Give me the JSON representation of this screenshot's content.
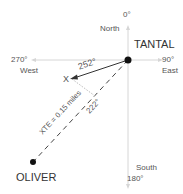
{
  "compass": {
    "north_deg": "0°",
    "north": "North",
    "east_deg": "90°",
    "east": "East",
    "south_deg": "180°",
    "south": "South",
    "west_deg": "270°",
    "west": "West"
  },
  "waypoints": {
    "origin": "TANTAL",
    "destination": "OLIVER",
    "current_position": "X"
  },
  "bearings": {
    "actual_track": "252°",
    "desired_track": "222°"
  },
  "cross_track_error": "XTE = 0.15 miles",
  "colors": {
    "axis": "#cfcfcf",
    "track": "#333333",
    "dot": "#111111",
    "perpendicular": "#bbbbbb"
  }
}
